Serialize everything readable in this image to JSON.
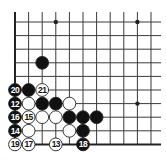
{
  "diagram": {
    "type": "go-board-fragment",
    "visible_cols": 11,
    "visible_rows": 10,
    "edges": {
      "left": true,
      "bottom": true,
      "top": false,
      "right": false
    },
    "star_points": [
      {
        "col": 3,
        "row": 0
      },
      {
        "col": 9,
        "row": 0
      },
      {
        "col": 9,
        "row": 6
      }
    ],
    "stones": [
      {
        "col": 2,
        "row": 3,
        "color": "black",
        "label": ""
      },
      {
        "col": 0,
        "row": 5,
        "color": "black",
        "label": "20"
      },
      {
        "col": 1,
        "row": 5,
        "color": "black",
        "label": ""
      },
      {
        "col": 2,
        "row": 5,
        "color": "white",
        "label": "21"
      },
      {
        "col": 0,
        "row": 6,
        "color": "black",
        "label": "12"
      },
      {
        "col": 1,
        "row": 6,
        "color": "white",
        "label": ""
      },
      {
        "col": 2,
        "row": 6,
        "color": "black",
        "label": ""
      },
      {
        "col": 3,
        "row": 6,
        "color": "black",
        "label": ""
      },
      {
        "col": 4,
        "row": 6,
        "color": "white",
        "label": ""
      },
      {
        "col": 0,
        "row": 7,
        "color": "black",
        "label": "16"
      },
      {
        "col": 1,
        "row": 7,
        "color": "white",
        "label": "15"
      },
      {
        "col": 2,
        "row": 7,
        "color": "white",
        "label": ""
      },
      {
        "col": 3,
        "row": 7,
        "color": "white",
        "label": ""
      },
      {
        "col": 4,
        "row": 7,
        "color": "black",
        "label": ""
      },
      {
        "col": 5,
        "row": 7,
        "color": "black",
        "label": ""
      },
      {
        "col": 6,
        "row": 7,
        "color": "black",
        "label": ""
      },
      {
        "col": 0,
        "row": 8,
        "color": "black",
        "label": "14"
      },
      {
        "col": 1,
        "row": 8,
        "color": "white",
        "label": ""
      },
      {
        "col": 4,
        "row": 8,
        "color": "white",
        "label": ""
      },
      {
        "col": 5,
        "row": 8,
        "color": "black",
        "label": ""
      },
      {
        "col": 0,
        "row": 9,
        "color": "white",
        "label": "19"
      },
      {
        "col": 1,
        "row": 9,
        "color": "white",
        "label": "17"
      },
      {
        "col": 3,
        "row": 9,
        "color": "white",
        "label": "13"
      },
      {
        "col": 5,
        "row": 9,
        "color": "black",
        "label": "18"
      }
    ],
    "colors": {
      "line": "#3a3a3a",
      "edge": "#222222",
      "black_stone": "#111111",
      "white_stone": "#ffffff",
      "stone_outline": "#222222",
      "label_on_black": "#ffffff",
      "label_on_white": "#111111"
    }
  },
  "caption": {
    "text": ""
  }
}
